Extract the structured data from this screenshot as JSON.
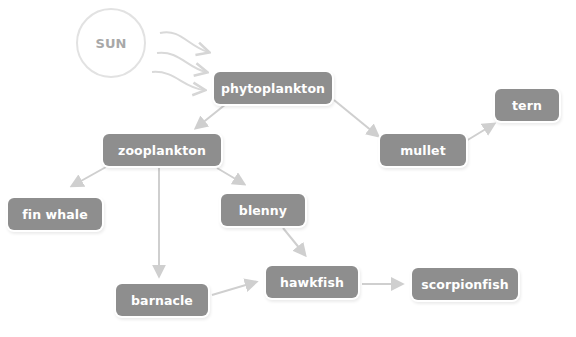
{
  "diagram": {
    "source": {
      "id": "sun",
      "label": "SUN"
    },
    "nodes": [
      {
        "id": "phytoplankton",
        "label": "phytoplankton",
        "x": 214,
        "y": 72,
        "w": 118,
        "h": 32
      },
      {
        "id": "zooplankton",
        "label": "zooplankton",
        "x": 103,
        "y": 134,
        "w": 118,
        "h": 32
      },
      {
        "id": "mullet",
        "label": "mullet",
        "x": 380,
        "y": 134,
        "w": 86,
        "h": 32
      },
      {
        "id": "tern",
        "label": "tern",
        "x": 495,
        "y": 89,
        "w": 64,
        "h": 32
      },
      {
        "id": "fin-whale",
        "label": "fin whale",
        "x": 8,
        "y": 198,
        "w": 94,
        "h": 32
      },
      {
        "id": "blenny",
        "label": "blenny",
        "x": 221,
        "y": 194,
        "w": 84,
        "h": 32
      },
      {
        "id": "hawkfish",
        "label": "hawkfish",
        "x": 266,
        "y": 266,
        "w": 92,
        "h": 32
      },
      {
        "id": "scorpionfish",
        "label": "scorpionfish",
        "x": 412,
        "y": 268,
        "w": 106,
        "h": 32
      },
      {
        "id": "barnacle",
        "label": "barnacle",
        "x": 116,
        "y": 284,
        "w": 92,
        "h": 32
      }
    ],
    "edges": [
      {
        "from": "sun",
        "to": "phytoplankton",
        "kind": "energy"
      },
      {
        "from": "phytoplankton",
        "to": "zooplankton"
      },
      {
        "from": "phytoplankton",
        "to": "mullet"
      },
      {
        "from": "mullet",
        "to": "tern"
      },
      {
        "from": "zooplankton",
        "to": "fin-whale"
      },
      {
        "from": "zooplankton",
        "to": "blenny"
      },
      {
        "from": "zooplankton",
        "to": "barnacle"
      },
      {
        "from": "blenny",
        "to": "hawkfish"
      },
      {
        "from": "barnacle",
        "to": "hawkfish"
      },
      {
        "from": "hawkfish",
        "to": "scorpionfish"
      }
    ],
    "colors": {
      "node_fill": "#8e8e8e",
      "node_text": "#ffffff",
      "arrow": "#cfcfcf",
      "sun_outline": "#e2e2e2",
      "sun_text": "#a8a8a8"
    }
  }
}
